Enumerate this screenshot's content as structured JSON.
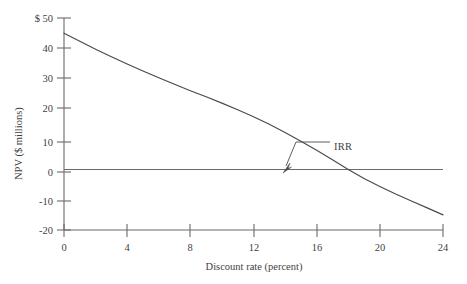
{
  "chart_data": {
    "type": "line",
    "title": "",
    "xlabel": "Discount rate (percent)",
    "ylabel": "NPV ($ millions)",
    "xlim": [
      0,
      24
    ],
    "ylim": [
      -20,
      50
    ],
    "grid": false,
    "legend": null,
    "x_ticks": [
      0,
      4,
      8,
      12,
      16,
      20,
      24
    ],
    "x_tick_labels": [
      "0",
      "4",
      "8",
      "12",
      "16",
      "20",
      "24"
    ],
    "y_ticks": [
      -20,
      -10,
      0,
      10,
      20,
      30,
      40,
      50
    ],
    "y_tick_labels": [
      "-20",
      "-10",
      "0",
      "10",
      "20",
      "30",
      "40",
      "$ 50"
    ],
    "series": [
      {
        "name": "NPV profile",
        "x": [
          0,
          1,
          2,
          3,
          4,
          5,
          6,
          7,
          8,
          9,
          10,
          11,
          12,
          13,
          14,
          15,
          16,
          17,
          18,
          19,
          20,
          21,
          22,
          23,
          24
        ],
        "values": [
          45.0,
          42.3,
          39.7,
          37.2,
          34.8,
          32.5,
          30.3,
          28.1,
          26.0,
          24.0,
          21.9,
          19.7,
          17.4,
          14.9,
          12.2,
          9.3,
          6.3,
          3.2,
          0.0,
          -3.0,
          -5.6,
          -8.1,
          -10.4,
          -12.7,
          -15.0
        ]
      },
      {
        "name": "zero reference line",
        "x": [
          0,
          24
        ],
        "values": [
          0,
          0
        ]
      }
    ],
    "annotations": [
      {
        "label": "IRR",
        "x": 13.8,
        "y": 0,
        "note": "Internal rate of return: discount rate at which NPV crosses zero"
      }
    ]
  },
  "axis": {
    "y_title": "NPV ($ millions)",
    "x_title": "Discount rate (percent)"
  },
  "annotation": {
    "irr_label": "IRR"
  },
  "colors": {
    "curve": "#4a4a4a",
    "axis": "#6a6a6a",
    "text": "#3f3f3f",
    "background": "#ffffff"
  }
}
